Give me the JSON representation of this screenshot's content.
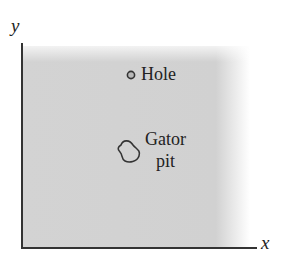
{
  "diagram": {
    "axes": {
      "x_label": "x",
      "y_label": "y"
    },
    "features": [
      {
        "name": "Hole",
        "label": "Hole",
        "shape": "small-circle",
        "position_px": [
          131,
          75
        ]
      },
      {
        "name": "Gator pit",
        "label_line1": "Gator",
        "label_line2": "pit",
        "shape": "irregular-blob",
        "position_px": [
          126,
          153
        ]
      }
    ],
    "region": {
      "description": "shaded field",
      "fill_color": "#d1d1d1"
    },
    "colors": {
      "axis": "#333333",
      "text": "#222222",
      "outline": "#333333",
      "hole_fill": "#b8b8b8"
    }
  }
}
